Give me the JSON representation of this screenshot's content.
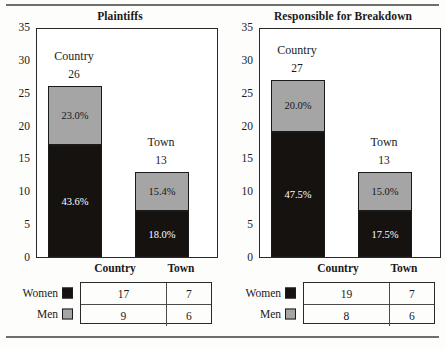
{
  "figure": {
    "rule_top": "horizontal-rule",
    "rule_bottom": "horizontal-rule"
  },
  "chart_data": [
    {
      "type": "bar",
      "title": "Plaintiffs",
      "subtype": "stacked",
      "xlabel": "",
      "ylabel": "",
      "ylim": [
        0,
        35
      ],
      "yticks": [
        0,
        5,
        10,
        15,
        20,
        25,
        30,
        35
      ],
      "ytick_labels": [
        "0",
        "5",
        "10",
        "15",
        "20",
        "25",
        "30",
        "35"
      ],
      "grid": false,
      "legend_position": "below-table",
      "categories": [
        "Country",
        "Town"
      ],
      "category_labels": [
        "Country",
        "Town"
      ],
      "totals": [
        26,
        13
      ],
      "total_labels": [
        "26",
        "13"
      ],
      "series": [
        {
          "name": "Women",
          "color": "#151210",
          "values": [
            17,
            7
          ],
          "data_labels": [
            "43.6%",
            "18.0%"
          ]
        },
        {
          "name": "Men",
          "color": "#a5a5a5",
          "values": [
            9,
            6
          ],
          "data_labels": [
            "23.0%",
            "15.4%"
          ]
        }
      ],
      "table": {
        "columns": [
          "Country",
          "Town"
        ],
        "rows": [
          {
            "label": "Women",
            "swatch": "women-swatch",
            "values": [
              "17",
              "7"
            ]
          },
          {
            "label": "Men",
            "swatch": "men-swatch",
            "values": [
              "9",
              "6"
            ]
          }
        ]
      }
    },
    {
      "type": "bar",
      "title": "Responsible for Breakdown",
      "subtype": "stacked",
      "xlabel": "",
      "ylabel": "",
      "ylim": [
        0,
        35
      ],
      "yticks": [
        0,
        5,
        10,
        15,
        20,
        25,
        30,
        35
      ],
      "ytick_labels": [
        "0",
        "5",
        "10",
        "15",
        "20",
        "25",
        "30",
        "35"
      ],
      "grid": false,
      "legend_position": "below-table",
      "categories": [
        "Country",
        "Town"
      ],
      "category_labels": [
        "Country",
        "Town"
      ],
      "totals": [
        27,
        13
      ],
      "total_labels": [
        "27",
        "13"
      ],
      "series": [
        {
          "name": "Women",
          "color": "#151210",
          "values": [
            19,
            7
          ],
          "data_labels": [
            "47.5%",
            "17.5%"
          ]
        },
        {
          "name": "Men",
          "color": "#a5a5a5",
          "values": [
            8,
            6
          ],
          "data_labels": [
            "20.0%",
            "15.0%"
          ]
        }
      ],
      "table": {
        "columns": [
          "Country",
          "Town"
        ],
        "rows": [
          {
            "label": "Women",
            "swatch": "women-swatch",
            "values": [
              "19",
              "7"
            ]
          },
          {
            "label": "Men",
            "swatch": "men-swatch",
            "values": [
              "8",
              "6"
            ]
          }
        ]
      }
    }
  ]
}
